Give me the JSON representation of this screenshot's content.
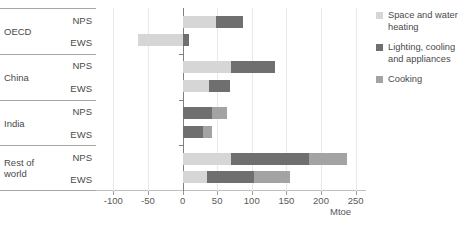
{
  "chart_data": {
    "type": "bar",
    "orientation": "horizontal",
    "stacked": true,
    "title": "",
    "xlabel": "Mtoe",
    "ylabel": "",
    "xlim": [
      -125,
      265
    ],
    "xticks": [
      -100,
      -50,
      0,
      50,
      100,
      150,
      200,
      250
    ],
    "xticklabels": [
      "-100",
      "-50",
      "0",
      "50",
      "100",
      "150",
      "200",
      "250"
    ],
    "grid": true,
    "legend_position": "right",
    "series": [
      {
        "name": "Space and water heating",
        "color": "#d6d6d6"
      },
      {
        "name": "Lighting, cooling and appliances",
        "color": "#6f6f6f"
      },
      {
        "name": "Cooking",
        "color": "#a3a3a3"
      }
    ],
    "groups": [
      {
        "category": "OECD",
        "rows": [
          {
            "scenario": "NPS",
            "segments": [
              {
                "series": "Space and water heating",
                "start": 0,
                "end": 48
              },
              {
                "series": "Lighting, cooling and appliances",
                "start": 48,
                "end": 88
              }
            ]
          },
          {
            "scenario": "EWS",
            "segments": [
              {
                "series": "Space and water heating",
                "start": -65,
                "end": 0
              },
              {
                "series": "Lighting, cooling and appliances",
                "start": 0,
                "end": 10
              }
            ]
          }
        ]
      },
      {
        "category": "China",
        "rows": [
          {
            "scenario": "NPS",
            "segments": [
              {
                "series": "Space and water heating",
                "start": 0,
                "end": 70
              },
              {
                "series": "Lighting, cooling and appliances",
                "start": 70,
                "end": 134
              }
            ]
          },
          {
            "scenario": "EWS",
            "segments": [
              {
                "series": "Space and water heating",
                "start": 0,
                "end": 38
              },
              {
                "series": "Lighting, cooling and appliances",
                "start": 38,
                "end": 68
              }
            ]
          }
        ]
      },
      {
        "category": "India",
        "rows": [
          {
            "scenario": "NPS",
            "segments": [
              {
                "series": "Lighting, cooling and appliances",
                "start": 0,
                "end": 42
              },
              {
                "series": "Cooking",
                "start": 42,
                "end": 64
              }
            ]
          },
          {
            "scenario": "EWS",
            "segments": [
              {
                "series": "Lighting, cooling and appliances",
                "start": 0,
                "end": 30
              },
              {
                "series": "Cooking",
                "start": 30,
                "end": 42
              }
            ]
          }
        ]
      },
      {
        "category": "Rest of world",
        "rows": [
          {
            "scenario": "NPS",
            "segments": [
              {
                "series": "Space and water heating",
                "start": 0,
                "end": 70
              },
              {
                "series": "Lighting, cooling and appliances",
                "start": 70,
                "end": 182
              },
              {
                "series": "Cooking",
                "start": 182,
                "end": 238
              }
            ]
          },
          {
            "scenario": "EWS",
            "segments": [
              {
                "series": "Space and water heating",
                "start": 0,
                "end": 35
              },
              {
                "series": "Lighting, cooling and appliances",
                "start": 35,
                "end": 103
              },
              {
                "series": "Cooking",
                "start": 103,
                "end": 155
              }
            ]
          }
        ]
      }
    ]
  },
  "legend": {
    "items": [
      {
        "label": "Space and water heating",
        "color": "#d6d6d6"
      },
      {
        "label": "Lighting, cooling and appliances",
        "color": "#6f6f6f"
      },
      {
        "label": "Cooking",
        "color": "#a3a3a3"
      }
    ]
  },
  "axis": {
    "x_title": "Mtoe"
  }
}
